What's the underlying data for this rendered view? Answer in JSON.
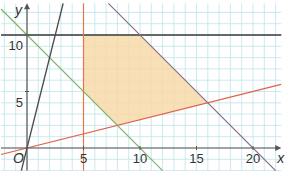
{
  "chart_data": {
    "type": "line",
    "title": "",
    "xlabel": "x",
    "ylabel": "y",
    "origin_label": "O",
    "xlim": [
      -2.3,
      22.5
    ],
    "ylim": [
      -2,
      12.8
    ],
    "grid": true,
    "x_ticks": [
      5,
      10,
      15,
      20
    ],
    "x_tick_labels": [
      "5",
      "10",
      "15",
      "20"
    ],
    "y_ticks": [
      5,
      10
    ],
    "y_tick_labels": [
      "5",
      "10"
    ],
    "series": [
      {
        "name": "y = 10",
        "color": "#3a3a3a",
        "points": [
          [
            -2.3,
            10
          ],
          [
            22.5,
            10
          ]
        ]
      },
      {
        "name": "x = 5",
        "color": "#e0784a",
        "points": [
          [
            5,
            -2
          ],
          [
            5,
            12.8
          ]
        ]
      },
      {
        "name": "y = x/4",
        "color": "#e0604a",
        "points": [
          [
            -2.3,
            -0.575
          ],
          [
            22.5,
            5.625
          ]
        ]
      },
      {
        "name": "x + y = 10",
        "color": "#7fb46a",
        "points": [
          [
            -2.3,
            12.3
          ],
          [
            12,
            -2
          ]
        ]
      },
      {
        "name": "x + y = 20",
        "color": "#8a6a8e",
        "points": [
          [
            7.2,
            12.8
          ],
          [
            22,
            -2
          ]
        ]
      },
      {
        "name": "y = 4x",
        "color": "#4a4a4a",
        "points": [
          [
            -0.5,
            -2
          ],
          [
            3.2,
            12.8
          ]
        ]
      }
    ],
    "feasible_region": {
      "color": "#f7d9a8",
      "vertices": [
        [
          5,
          10
        ],
        [
          10,
          10
        ],
        [
          16,
          4
        ],
        [
          8,
          2
        ],
        [
          5,
          5
        ]
      ]
    }
  },
  "colors": {
    "grid": "#bfe3ea",
    "axis": "#555555",
    "background": "#ffffff"
  }
}
